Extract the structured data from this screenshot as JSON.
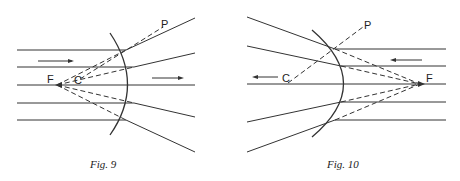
{
  "figures": [
    {
      "id": "fig9",
      "caption": "Fig. 9",
      "labels": {
        "focus": "F",
        "center": "C",
        "point": "P"
      },
      "mirror": "convex",
      "rays_direction": "left-to-right"
    },
    {
      "id": "fig10",
      "caption": "Fig. 10",
      "labels": {
        "focus": "F",
        "center": "C",
        "point": "P"
      },
      "mirror": "convex",
      "rays_direction": "right-to-left"
    }
  ],
  "colors": {
    "line": "#333333",
    "background": "#ffffff"
  }
}
